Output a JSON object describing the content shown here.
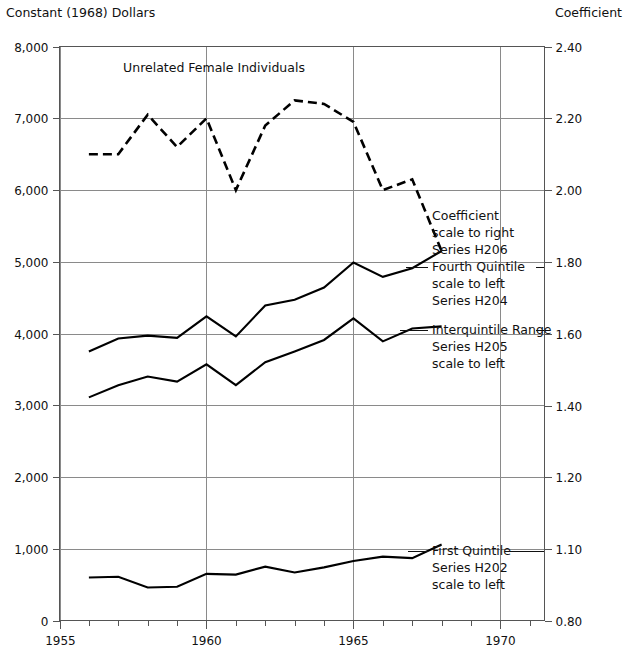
{
  "header": {
    "left_axis_title": "Constant (1968) Dollars",
    "right_axis_title": "Coefficient"
  },
  "chart_data": {
    "type": "line",
    "title": "Unrelated Female Individuals",
    "xlabel": "",
    "ylabel": "Constant (1968) Dollars",
    "y2label": "Coefficient",
    "grid": true,
    "legend_position": "inline-annotations",
    "xlim": [
      1955,
      1971.5
    ],
    "xticks": [
      1955,
      1960,
      1965,
      1970
    ],
    "xtick_labels": [
      "1955",
      "1960",
      "1965",
      "1970"
    ],
    "x_minor_ticks": [
      1956,
      1957,
      1958,
      1959,
      1961,
      1962,
      1963,
      1964,
      1966,
      1967,
      1968,
      1969,
      1971
    ],
    "ylim": [
      0,
      8000
    ],
    "yticks": [
      0,
      1000,
      2000,
      3000,
      4000,
      5000,
      6000,
      7000,
      8000
    ],
    "ytick_labels": [
      "0",
      "1,000",
      "2,000",
      "3,000",
      "4,000",
      "5,000",
      "6,000",
      "7,000",
      "8,000"
    ],
    "y2_ticks": [
      0.8,
      1.1,
      1.2,
      1.4,
      1.6,
      1.8,
      2.0,
      2.2,
      2.4
    ],
    "y2_tick_labels": [
      "0.80",
      "1.10",
      "1.20",
      "1.40",
      "1.60",
      "1.80",
      "2.00",
      "2.20",
      "2.40"
    ],
    "series": [
      {
        "name": "Coefficient",
        "code": "H206",
        "style": "dashed",
        "axis": "right",
        "annotation": [
          "Coefficient",
          "scale to right",
          "Series H206"
        ],
        "x": [
          1956,
          1957,
          1958,
          1959,
          1960,
          1961,
          1962,
          1963,
          1964,
          1965,
          1966,
          1967,
          1968
        ],
        "values": [
          2.1,
          2.1,
          2.21,
          2.12,
          2.2,
          2.0,
          2.18,
          2.25,
          2.24,
          2.19,
          2.0,
          2.03,
          1.83
        ]
      },
      {
        "name": "Fourth Quintile",
        "code": "H204",
        "style": "solid",
        "axis": "left",
        "annotation": [
          "Fourth Quintile",
          "scale to left",
          "Series H204"
        ],
        "x": [
          1956,
          1957,
          1958,
          1959,
          1960,
          1961,
          1962,
          1963,
          1964,
          1965,
          1966,
          1967,
          1968
        ],
        "values": [
          3750,
          3930,
          3970,
          3940,
          4240,
          3960,
          4390,
          4470,
          4640,
          4990,
          4790,
          4910,
          5150
        ]
      },
      {
        "name": "Interquintile Range",
        "code": "H205",
        "style": "solid",
        "axis": "left",
        "annotation": [
          "Interquintile Range",
          "Series H205",
          "scale to left"
        ],
        "x": [
          1956,
          1957,
          1958,
          1959,
          1960,
          1961,
          1962,
          1963,
          1964,
          1965,
          1966,
          1967,
          1968
        ],
        "values": [
          3110,
          3280,
          3400,
          3330,
          3570,
          3280,
          3600,
          3750,
          3910,
          4210,
          3890,
          4070,
          4100
        ]
      },
      {
        "name": "First Quintile",
        "code": "H202",
        "style": "solid",
        "axis": "left",
        "annotation": [
          "First Quintile",
          "Series H202",
          "scale to left"
        ],
        "x": [
          1956,
          1957,
          1958,
          1959,
          1960,
          1961,
          1962,
          1963,
          1964,
          1965,
          1966,
          1967,
          1968
        ],
        "values": [
          600,
          610,
          460,
          470,
          650,
          640,
          750,
          670,
          740,
          830,
          890,
          870,
          1060
        ]
      }
    ]
  }
}
